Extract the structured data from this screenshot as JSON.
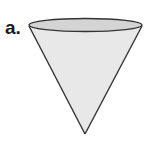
{
  "figure": {
    "label": "a.",
    "shape": "cone",
    "orientation": "apex-down",
    "colors": {
      "fill_side": "#e8e8e8",
      "fill_top": "#d4d4d4",
      "stroke": "#333333"
    }
  }
}
